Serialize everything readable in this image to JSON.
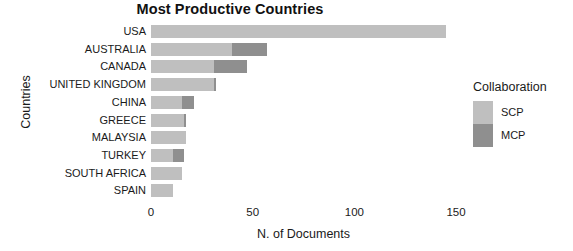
{
  "chart_data": {
    "type": "bar",
    "orientation": "horizontal",
    "stacked": true,
    "title": "Most Productive Countries",
    "xlabel": "N. of Documents",
    "ylabel": "Countries",
    "xlim": [
      0,
      150
    ],
    "xticks": [
      0,
      50,
      100,
      150
    ],
    "xtick_labels": [
      "0",
      "50",
      "100",
      "150"
    ],
    "grid": false,
    "legend_position": "right",
    "legend_title": "Collaboration",
    "categories": [
      "USA",
      "AUSTRALIA",
      "CANADA",
      "UNITED KINGDOM",
      "CHINA",
      "GREECE",
      "MALAYSIA",
      "TURKEY",
      "SOUTH AFRICA",
      "SPAIN"
    ],
    "series": [
      {
        "name": "SCP",
        "color": "#bfbfbf",
        "values": [
          145,
          40,
          31,
          31,
          15,
          16,
          17,
          11,
          15,
          11
        ]
      },
      {
        "name": "MCP",
        "color": "#8f8f8f",
        "values": [
          0,
          17,
          16,
          1,
          6,
          1,
          0,
          5,
          0,
          0
        ]
      }
    ],
    "totals": [
      145,
      57,
      47,
      32,
      21,
      17,
      17,
      16,
      15,
      11
    ]
  }
}
